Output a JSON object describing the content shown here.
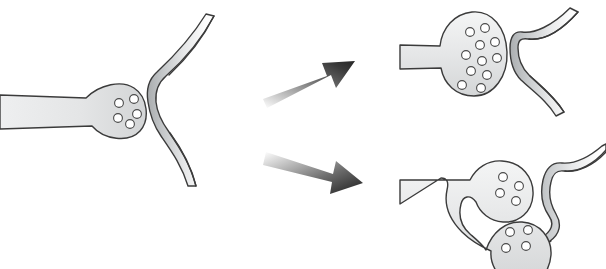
{
  "figure": {
    "subtitle": "A baseline axon terminal transforms into either an enlarged vesicle-rich bouton or a bifurcated perforated synapse",
    "background_color": "#ffffff",
    "width": 606,
    "height": 269
  },
  "palette": {
    "outline": "#3b3b3b",
    "vesicle_stroke": "#4a4a4a",
    "vesicle_fill": "#ffffff",
    "terminal_fill_light": "#eceded",
    "terminal_fill_dark": "#d2d4d5",
    "dendrite_fill_dark": "#b9bcbe",
    "dendrite_fill_light": "#ffffff",
    "arrow_dark": "#2b2b2b",
    "arrow_light": "#f2f2f2"
  },
  "panels": [
    {
      "id": "baseline",
      "name": "baseline-synapse",
      "label": "Baseline synapse",
      "role": "source",
      "axon_terminal": {
        "name": "presynaptic-terminal-baseline",
        "shape": "single bulbous bouton on a straight axon shaft",
        "vesicle_count": 5,
        "vesicle_radius": 4.4,
        "vesicles": [
          {
            "cx": 119,
            "cy": 103
          },
          {
            "cx": 134,
            "cy": 99
          },
          {
            "cx": 137,
            "cy": 114
          },
          {
            "cx": 118,
            "cy": 118
          },
          {
            "cx": 130,
            "cy": 124
          }
        ]
      },
      "postsynaptic": {
        "name": "postsynaptic-dendritic-spine-baseline",
        "shape": "concave single-apposition spine head",
        "apposition_count": 1
      }
    },
    {
      "id": "enlarged",
      "name": "enlarged-synapse",
      "label": "Enlarged bouton",
      "role": "outcome-top",
      "axon_terminal": {
        "name": "presynaptic-terminal-enlarged",
        "shape": "greatly enlarged oval bouton, vesicle-rich",
        "vesicle_count": 11,
        "vesicle_radius": 4.4,
        "vesicles": [
          {
            "cx": 470,
            "cy": 32
          },
          {
            "cx": 485,
            "cy": 28
          },
          {
            "cx": 480,
            "cy": 45
          },
          {
            "cx": 495,
            "cy": 42
          },
          {
            "cx": 466,
            "cy": 55
          },
          {
            "cx": 482,
            "cy": 61
          },
          {
            "cx": 497,
            "cy": 58
          },
          {
            "cx": 471,
            "cy": 71
          },
          {
            "cx": 487,
            "cy": 75
          },
          {
            "cx": 462,
            "cy": 85
          },
          {
            "cx": 481,
            "cy": 88
          }
        ]
      },
      "postsynaptic": {
        "name": "postsynaptic-dendritic-spine-enlarged",
        "shape": "widened concave spine head with broad active zone",
        "apposition_count": 1
      }
    },
    {
      "id": "bifurcated",
      "name": "bifurcated-synapse",
      "label": "Bifurcated / perforated synapse",
      "role": "outcome-bottom",
      "axon_terminal": {
        "name": "presynaptic-terminal-bifurcated",
        "shape": "axon splitting into two separate boutons",
        "bouton_count": 2,
        "vesicle_count": 8,
        "vesicle_radius": 4.4,
        "boutons": [
          {
            "name": "upper-bouton",
            "vesicle_count": 4,
            "vesicles": [
              {
                "cx": 503,
                "cy": 177
              },
              {
                "cx": 519,
                "cy": 186
              },
              {
                "cx": 500,
                "cy": 193
              },
              {
                "cx": 516,
                "cy": 201
              }
            ]
          },
          {
            "name": "lower-bouton",
            "vesicle_count": 4,
            "vesicles": [
              {
                "cx": 510,
                "cy": 232
              },
              {
                "cx": 528,
                "cy": 230
              },
              {
                "cx": 506,
                "cy": 248
              },
              {
                "cx": 526,
                "cy": 246
              }
            ]
          }
        ]
      },
      "postsynaptic": {
        "name": "postsynaptic-dendritic-spine-bifurcated",
        "shape": "spine with a central indentation separating two appositions",
        "apposition_count": 2
      }
    }
  ],
  "arrows": [
    {
      "id": "arrow-top",
      "name": "transition-arrow-upper",
      "direction": "up-right",
      "from_panel": "baseline",
      "to_panel": "enlarged",
      "gradient": "light-to-dark",
      "start": {
        "x": 265,
        "y": 93
      },
      "end": {
        "x": 352,
        "y": 62
      }
    },
    {
      "id": "arrow-bottom",
      "name": "transition-arrow-lower",
      "direction": "down-right",
      "from_panel": "baseline",
      "to_panel": "bifurcated",
      "gradient": "light-to-dark",
      "start": {
        "x": 267,
        "y": 158
      },
      "end": {
        "x": 360,
        "y": 186
      }
    }
  ]
}
